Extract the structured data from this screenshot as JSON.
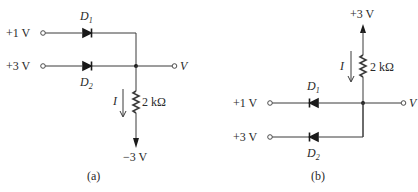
{
  "figure_a": {
    "caption": "(a)",
    "inputs": [
      {
        "label": "+1 V",
        "diode": "D",
        "diode_sub": "1"
      },
      {
        "label": "+3 V",
        "diode": "D",
        "diode_sub": "2"
      }
    ],
    "output_label": "V",
    "current_label": "I",
    "resistor_label": "2 kΩ",
    "supply_label": "−3 V"
  },
  "figure_b": {
    "caption": "(b)",
    "inputs": [
      {
        "label": "+1 V",
        "diode": "D",
        "diode_sub": "1"
      },
      {
        "label": "+3 V",
        "diode": "D",
        "diode_sub": "2"
      }
    ],
    "output_label": "V",
    "current_label": "I",
    "resistor_label": "2 kΩ",
    "supply_label": "+3 V"
  }
}
